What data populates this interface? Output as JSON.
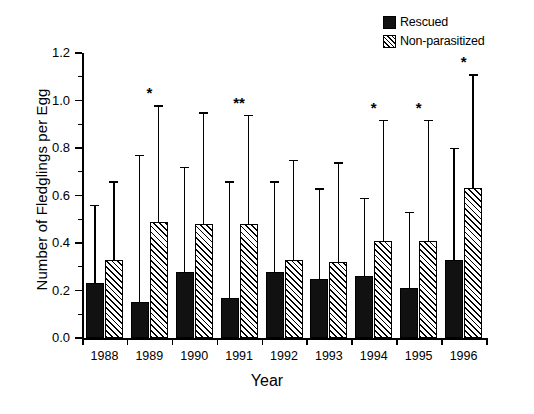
{
  "chart_data": {
    "type": "bar",
    "title": "",
    "xlabel": "Year",
    "ylabel": "Number of Fledglings per Egg",
    "categories": [
      "1988",
      "1989",
      "1990",
      "1991",
      "1992",
      "1993",
      "1994",
      "1995",
      "1996"
    ],
    "ylim": [
      0.0,
      1.2
    ],
    "yticks": [
      "0.0",
      "0.2",
      "0.4",
      "0.6",
      "0.8",
      "1.0",
      "1.2"
    ],
    "ytick_values": [
      0.0,
      0.2,
      0.4,
      0.6,
      0.8,
      1.0,
      1.2
    ],
    "grid": false,
    "legend_position": "top-right",
    "series": [
      {
        "name": "Rescued",
        "fill": "solid-black",
        "color": "#111111",
        "values": [
          0.23,
          0.15,
          0.28,
          0.17,
          0.28,
          0.25,
          0.26,
          0.21,
          0.33
        ],
        "error_upper": [
          0.56,
          0.77,
          0.72,
          0.66,
          0.66,
          0.63,
          0.59,
          0.53,
          0.8
        ]
      },
      {
        "name": "Non-parasitized",
        "fill": "diagonal-hatch",
        "color": "#ffffff",
        "values": [
          0.33,
          0.49,
          0.48,
          0.48,
          0.33,
          0.32,
          0.41,
          0.41,
          0.63
        ],
        "error_upper": [
          0.66,
          0.98,
          0.95,
          0.94,
          0.75,
          0.74,
          0.92,
          0.92,
          1.11
        ]
      }
    ],
    "annotations": [
      {
        "category": "1988",
        "text": ""
      },
      {
        "category": "1989",
        "text": "*"
      },
      {
        "category": "1990",
        "text": ""
      },
      {
        "category": "1991",
        "text": "**"
      },
      {
        "category": "1992",
        "text": ""
      },
      {
        "category": "1993",
        "text": ""
      },
      {
        "category": "1994",
        "text": "*"
      },
      {
        "category": "1995",
        "text": "*"
      },
      {
        "category": "1996",
        "text": "*"
      }
    ]
  },
  "legend": {
    "items": [
      {
        "label": "Rescued",
        "swatch": "solid-black-square"
      },
      {
        "label": "Non-parasitized",
        "swatch": "hatched-square"
      }
    ]
  },
  "axes": {
    "y_title": "Number of Fledglings per Egg",
    "x_title": "Year"
  }
}
